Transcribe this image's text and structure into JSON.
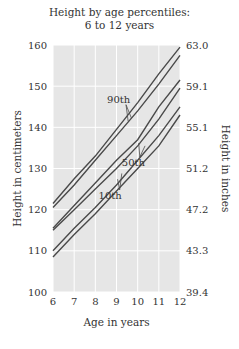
{
  "chart_data": {
    "type": "line",
    "title": "Height by age percentiles:",
    "subtitle": "6 to 12 years",
    "xlabel": "Age in years",
    "ylabel": "Height in centimeters",
    "ylabel_right": "Height in inches",
    "x": [
      6,
      7,
      8,
      9,
      10,
      11,
      12
    ],
    "xlim": [
      6,
      12
    ],
    "ylim": [
      100,
      160
    ],
    "yticks_left": [
      "160",
      "150",
      "140",
      "130",
      "120",
      "110",
      "100"
    ],
    "yticks_right": [
      "63.0",
      "59.1",
      "55.1",
      "51.2",
      "47.2",
      "43.3",
      "39.4"
    ],
    "xticks": [
      "6",
      "7",
      "8",
      "9",
      "10",
      "11",
      "12"
    ],
    "grid": true,
    "series": [
      {
        "name": "90th (upper)",
        "values": [
          121.5,
          127.5,
          133,
          139.5,
          146,
          153,
          159.5
        ]
      },
      {
        "name": "90th (lower)",
        "values": [
          120.5,
          126,
          132,
          138,
          144,
          150.5,
          157.5
        ]
      },
      {
        "name": "50th (upper)",
        "values": [
          115.5,
          121,
          126.5,
          132,
          137,
          145,
          151.5
        ]
      },
      {
        "name": "50th (lower)",
        "values": [
          115,
          120,
          125,
          130,
          135.5,
          142,
          149.5
        ]
      },
      {
        "name": "10th (upper)",
        "values": [
          110,
          115.5,
          120.5,
          126,
          132,
          138,
          145
        ]
      },
      {
        "name": "10th (lower)",
        "values": [
          108.5,
          114,
          119,
          124.5,
          130,
          135.5,
          143
        ]
      }
    ],
    "annotations": [
      {
        "text": "90th",
        "age": 9.1,
        "cm": 146
      },
      {
        "text": "50th",
        "age": 9.8,
        "cm": 130.5
      },
      {
        "text": "10th",
        "age": 8.7,
        "cm": 122.5
      }
    ],
    "colors": {
      "background": "#e6e6e6",
      "grid": "#ffffff",
      "line": "#4a4a4a"
    }
  }
}
